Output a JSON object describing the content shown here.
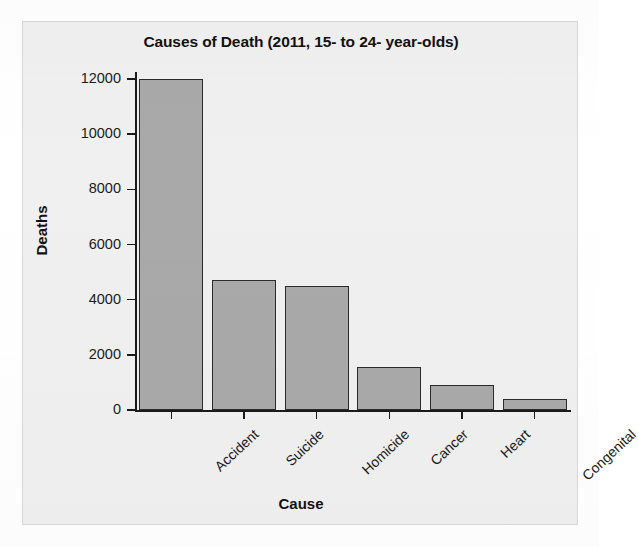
{
  "chart_data": {
    "type": "bar",
    "title": "Causes of Death (2011, 15- to 24- year-olds)",
    "xlabel": "Cause",
    "ylabel": "Deaths",
    "categories": [
      "Accident",
      "Suicide",
      "Homicide",
      "Cancer",
      "Heart",
      "Congenital"
    ],
    "values": [
      12000,
      4700,
      4500,
      1570,
      900,
      400
    ],
    "ylim": [
      0,
      12000
    ],
    "ytick_labels": [
      "12000",
      "10000",
      "8000",
      "6000",
      "4000",
      "2000",
      "0"
    ],
    "ytick_values": [
      12000,
      10000,
      8000,
      6000,
      4000,
      2000,
      0
    ],
    "grid": false,
    "legend": null,
    "bar_color": "#a9a9a9",
    "bar_edge_color": "#2b2b2b",
    "axis_color": "#1a1a1a",
    "text_color": "#1d1a17",
    "background_color": "#f0f0f0"
  }
}
